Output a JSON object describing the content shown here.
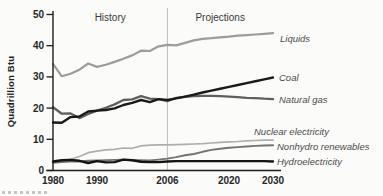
{
  "figure": {
    "history_label": "History",
    "projections_label": "Projections",
    "divider_year": 2006
  },
  "chart_data": {
    "type": "line",
    "title": "",
    "xlabel": "",
    "ylabel": "Quadrillion Btu",
    "xlim": [
      1980,
      2030
    ],
    "ylim": [
      0,
      50
    ],
    "y_ticks": [
      0,
      10,
      20,
      30,
      40,
      50
    ],
    "x_ticks": [
      "1980",
      "1990",
      "2006",
      "2020",
      "2030"
    ],
    "x_tick_years": [
      1980,
      1990,
      2006,
      2020,
      2030
    ],
    "grid": false,
    "legend_position": "right-inline-labels",
    "annotations": [
      "History",
      "Projections"
    ],
    "divider_x": 2006,
    "x": [
      1980,
      1982,
      1984,
      1986,
      1988,
      1990,
      1992,
      1994,
      1996,
      1998,
      2000,
      2002,
      2004,
      2006,
      2008,
      2010,
      2012,
      2014,
      2016,
      2018,
      2020,
      2022,
      2024,
      2026,
      2028,
      2030
    ],
    "series": [
      {
        "name": "Liquids",
        "color": "#9c9c9c",
        "width": 2.2,
        "values": [
          34.2,
          30.2,
          31.0,
          32.3,
          34.3,
          33.2,
          33.9,
          34.8,
          35.8,
          36.9,
          38.4,
          38.3,
          39.8,
          40.3,
          40.1,
          40.9,
          41.7,
          42.2,
          42.4,
          42.7,
          42.9,
          43.2,
          43.4,
          43.6,
          43.8,
          44.0
        ]
      },
      {
        "name": "Coal",
        "color": "#1a1a1a",
        "width": 2.4,
        "values": [
          15.4,
          15.3,
          17.1,
          17.3,
          18.9,
          19.2,
          19.4,
          19.9,
          21.0,
          21.7,
          22.6,
          21.9,
          22.9,
          22.6,
          23.1,
          23.7,
          24.3,
          25.0,
          25.6,
          26.2,
          26.8,
          27.4,
          28.0,
          28.6,
          29.2,
          29.8
        ]
      },
      {
        "name": "Natural gas",
        "color": "#5f5f5f",
        "width": 2.3,
        "values": [
          20.3,
          18.2,
          18.3,
          16.8,
          18.1,
          19.2,
          20.1,
          21.2,
          22.6,
          22.8,
          23.8,
          23.0,
          22.9,
          22.2,
          23.3,
          23.6,
          23.8,
          23.9,
          23.9,
          23.8,
          23.7,
          23.5,
          23.3,
          23.2,
          23.0,
          22.9
        ]
      },
      {
        "name": "Nuclear electricity",
        "color": "#aeaeae",
        "width": 1.7,
        "values": [
          2.7,
          3.1,
          3.6,
          4.5,
          5.7,
          6.2,
          6.6,
          6.8,
          7.2,
          7.1,
          7.9,
          8.1,
          8.2,
          8.2,
          8.3,
          8.4,
          8.5,
          8.6,
          8.8,
          9.0,
          9.2,
          9.3,
          9.5,
          9.6,
          9.7,
          9.7
        ]
      },
      {
        "name": "Nonhydro renewables",
        "color": "#737373",
        "width": 1.9,
        "values": [
          2.5,
          2.7,
          2.9,
          2.9,
          3.1,
          3.2,
          3.3,
          3.4,
          3.5,
          3.3,
          3.3,
          3.2,
          3.5,
          3.8,
          4.3,
          4.9,
          5.3,
          6.0,
          6.6,
          7.0,
          7.3,
          7.5,
          7.7,
          7.9,
          8.0,
          8.1
        ]
      },
      {
        "name": "Hydroelectricity",
        "color": "#141414",
        "width": 2.4,
        "values": [
          2.9,
          3.3,
          3.4,
          3.1,
          2.4,
          3.0,
          2.6,
          2.7,
          3.5,
          3.3,
          2.8,
          2.7,
          2.7,
          2.9,
          3.0,
          3.0,
          3.0,
          3.0,
          3.0,
          3.0,
          3.0,
          3.0,
          3.0,
          3.0,
          3.0,
          2.9
        ]
      }
    ]
  }
}
